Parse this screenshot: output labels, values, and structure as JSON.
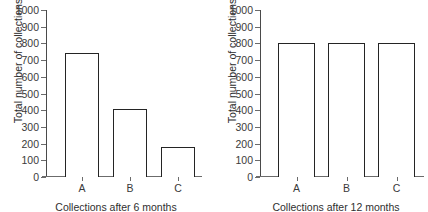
{
  "chart_data": [
    {
      "type": "bar",
      "title": "",
      "categories": [
        "A",
        "B",
        "C"
      ],
      "values": [
        740,
        410,
        180
      ],
      "xlabel": "Collections after 6 months",
      "ylabel": "Total number of collections",
      "ylim": [
        0,
        1000
      ],
      "ytick_labels": [
        "0",
        "100",
        "200",
        "300",
        "400",
        "500",
        "600",
        "700",
        "800",
        "900",
        "1000"
      ],
      "ytick_values": [
        0,
        100,
        200,
        300,
        400,
        500,
        600,
        700,
        800,
        900,
        1000
      ],
      "grid": false,
      "legend": "none",
      "bar_fill": "#ffffff",
      "bar_edge": "#242424",
      "axis_color": "#4a4a4a"
    },
    {
      "type": "bar",
      "title": "",
      "categories": [
        "A",
        "B",
        "C"
      ],
      "values": [
        800,
        800,
        800
      ],
      "xlabel": "Collections after 12 months",
      "ylabel": "Total number of collections",
      "ylim": [
        0,
        1000
      ],
      "ytick_labels": [
        "0",
        "100",
        "200",
        "300",
        "400",
        "500",
        "600",
        "700",
        "800",
        "900",
        "1000"
      ],
      "ytick_values": [
        0,
        100,
        200,
        300,
        400,
        500,
        600,
        700,
        800,
        900,
        1000
      ],
      "grid": false,
      "legend": "none",
      "bar_fill": "#ffffff",
      "bar_edge": "#242424",
      "axis_color": "#4a4a4a"
    }
  ]
}
